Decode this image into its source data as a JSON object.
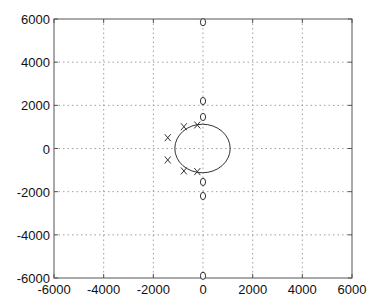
{
  "chart_data": {
    "type": "scatter",
    "title": "",
    "xlabel": "",
    "ylabel": "",
    "xlim": [
      -6000,
      6000
    ],
    "ylim": [
      -6000,
      6000
    ],
    "grid": true,
    "xticks": [
      "-6000",
      "-4000",
      "-2000",
      "0",
      "2000",
      "4000",
      "6000"
    ],
    "yticks": [
      "-6000",
      "-4000",
      "-2000",
      "0",
      "2000",
      "4000",
      "6000"
    ],
    "series": [
      {
        "name": "poles",
        "marker": "x",
        "points": [
          [
            -230,
            1090
          ],
          [
            -770,
            1010
          ],
          [
            -1420,
            500
          ],
          [
            -1420,
            -530
          ],
          [
            -770,
            -1040
          ],
          [
            -230,
            -1070
          ]
        ]
      },
      {
        "name": "zeros",
        "marker": "o",
        "points": [
          [
            0,
            5850
          ],
          [
            0,
            2200
          ],
          [
            0,
            1460
          ],
          [
            0,
            -1550
          ],
          [
            0,
            -2200
          ],
          [
            0,
            -5900
          ]
        ]
      },
      {
        "name": "reference-circle",
        "type": "ellipse",
        "center": [
          -20,
          0
        ],
        "radius_x": 1115,
        "radius_y": 1125
      }
    ]
  }
}
